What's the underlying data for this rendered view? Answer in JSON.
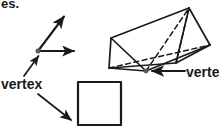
{
  "page": {
    "background_color": "#ffffff",
    "ink_color": "#1a1a1a",
    "vertex_dot_color": "#5a5a5a",
    "width": 219,
    "height": 135
  },
  "clipped_heading": {
    "visible_fragment": "es.",
    "note": "bottom sliver of a line of text cut off by the top crop edge"
  },
  "labels": {
    "vertex_left": "vertex",
    "vertex_right": "vertex"
  },
  "figures": [
    {
      "name": "angle",
      "kind": "angle-two-rays",
      "description": "Two rays with arrowheads meeting at a common marked vertex point",
      "vertex_point": [
        38,
        51
      ],
      "rays": [
        {
          "name": "ray-up-right",
          "from": [
            38,
            51
          ],
          "to": [
            66,
            14
          ]
        },
        {
          "name": "ray-right",
          "from": [
            38,
            51
          ],
          "to": [
            78,
            51
          ]
        }
      ]
    },
    {
      "name": "triangular-prism",
      "kind": "3d-triangular-prism",
      "description": "Triangular prism drawn in oblique view with dashed hidden edges; bottom-front vertex is marked",
      "marked_vertex": [
        146,
        71
      ],
      "visible_vertices": [
        [
          111,
          38
        ],
        [
          109,
          68
        ],
        [
          146,
          71
        ],
        [
          189,
          8
        ],
        [
          210,
          45
        ],
        [
          176,
          63
        ]
      ]
    },
    {
      "name": "square",
      "kind": "square",
      "description": "Axis-aligned square; arrow points to its lower-left vertex",
      "top_left": [
        78,
        82
      ],
      "size": 43,
      "marked_vertex": [
        78,
        125
      ]
    }
  ],
  "pointers": [
    {
      "name": "pointer-left-vertex-to-angle",
      "from_label": "vertex_left",
      "tail": [
        24,
        76
      ],
      "head": [
        40,
        54
      ],
      "target": "angle vertex"
    },
    {
      "name": "pointer-left-vertex-to-square",
      "from_label": "vertex_left",
      "tail": [
        38,
        94
      ],
      "head": [
        74,
        123
      ],
      "target": "square lower-left vertex"
    },
    {
      "name": "pointer-right-vertex-to-prism",
      "from_label": "vertex_right",
      "tail": [
        185,
        71
      ],
      "head": [
        150,
        71
      ],
      "target": "prism bottom-front vertex"
    }
  ]
}
